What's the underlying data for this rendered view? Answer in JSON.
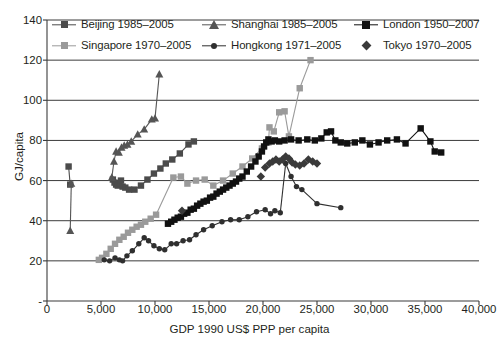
{
  "chart_data": {
    "type": "scatter",
    "title": "",
    "xlabel": "GDP 1990 US$ PPP per capita",
    "ylabel": "GJ/capita",
    "xlim": [
      0,
      40000
    ],
    "ylim": [
      0,
      140
    ],
    "xticks": [
      0,
      5000,
      10000,
      15000,
      20000,
      25000,
      30000,
      35000,
      40000
    ],
    "xticklabels": [
      "0",
      "5,000",
      "10,000",
      "15,000",
      "20,000",
      "25,000",
      "30,000",
      "35,000",
      "40,000"
    ],
    "yticks": [
      0,
      20,
      40,
      60,
      80,
      100,
      120,
      140
    ],
    "yticklabels": [
      "-",
      "20",
      "40",
      "60",
      "80",
      "100",
      "120",
      "140"
    ],
    "grid": "horizontal",
    "legend_position": "top-inside",
    "series": [
      {
        "name": "Beijing 1985–2005",
        "marker": "square",
        "color": "#4b4b4b",
        "line": true,
        "points": [
          [
            2000,
            67.0
          ],
          [
            2150,
            58.0
          ],
          [
            6100,
            60.5
          ],
          [
            6250,
            59.0
          ],
          [
            6400,
            58.0
          ],
          [
            6550,
            57.5
          ],
          [
            6700,
            58.5
          ],
          [
            6850,
            60.0
          ],
          [
            7000,
            57.0
          ],
          [
            7250,
            56.5
          ],
          [
            7600,
            55.5
          ],
          [
            8100,
            55.5
          ],
          [
            8700,
            57.5
          ],
          [
            9300,
            60.5
          ],
          [
            9900,
            63.5
          ],
          [
            10500,
            66.0
          ],
          [
            11000,
            68.5
          ],
          [
            11600,
            70.5
          ],
          [
            12300,
            73.5
          ],
          [
            13100,
            78.0
          ],
          [
            13600,
            79.5
          ]
        ]
      },
      {
        "name": "Shanghai 1985–2005",
        "marker": "triangle",
        "color": "#555555",
        "line": true,
        "points": [
          [
            2150,
            35.0
          ],
          [
            2250,
            58.5
          ],
          [
            6000,
            61.5
          ],
          [
            6200,
            69.5
          ],
          [
            6400,
            74.5
          ],
          [
            6650,
            74.0
          ],
          [
            6900,
            76.5
          ],
          [
            7150,
            77.5
          ],
          [
            7450,
            78.0
          ],
          [
            7800,
            79.5
          ],
          [
            8400,
            83.0
          ],
          [
            9000,
            85.5
          ],
          [
            9700,
            90.5
          ],
          [
            10000,
            91.0
          ],
          [
            10400,
            113.0
          ]
        ]
      },
      {
        "name": "Singapore 1970–2005",
        "marker": "square",
        "color": "#9a9a9a",
        "line": true,
        "points": [
          [
            4800,
            20.5
          ],
          [
            5100,
            21.5
          ],
          [
            5500,
            23.5
          ],
          [
            5900,
            26.0
          ],
          [
            6300,
            28.5
          ],
          [
            6700,
            30.5
          ],
          [
            7100,
            32.0
          ],
          [
            7500,
            34.0
          ],
          [
            7900,
            35.5
          ],
          [
            8300,
            37.0
          ],
          [
            8700,
            38.0
          ],
          [
            9100,
            39.5
          ],
          [
            9600,
            41.0
          ],
          [
            10100,
            43.0
          ],
          [
            11700,
            61.5
          ],
          [
            12400,
            62.0
          ],
          [
            13000,
            58.5
          ],
          [
            13800,
            60.0
          ],
          [
            14600,
            60.5
          ],
          [
            15400,
            57.5
          ],
          [
            16300,
            60.0
          ],
          [
            17200,
            63.5
          ],
          [
            18100,
            67.0
          ],
          [
            19000,
            71.0
          ],
          [
            19900,
            76.0
          ],
          [
            20500,
            79.0
          ],
          [
            20600,
            86.5
          ],
          [
            21000,
            84.5
          ],
          [
            21500,
            94.0
          ],
          [
            22000,
            94.5
          ],
          [
            22400,
            82.0
          ],
          [
            23400,
            106.0
          ],
          [
            24400,
            120.0
          ]
        ]
      },
      {
        "name": "Hongkong 1971–2005",
        "marker": "circle",
        "color": "#2f2f2f",
        "line": true,
        "points": [
          [
            5300,
            20.5
          ],
          [
            5800,
            20.0
          ],
          [
            6300,
            21.5
          ],
          [
            6700,
            20.5
          ],
          [
            7000,
            20.0
          ],
          [
            7400,
            22.5
          ],
          [
            7900,
            25.0
          ],
          [
            8500,
            28.5
          ],
          [
            9000,
            31.5
          ],
          [
            9400,
            30.0
          ],
          [
            9900,
            27.5
          ],
          [
            10400,
            26.0
          ],
          [
            10900,
            25.5
          ],
          [
            11500,
            28.5
          ],
          [
            12000,
            28.5
          ],
          [
            12600,
            30.0
          ],
          [
            13200,
            30.5
          ],
          [
            13800,
            33.0
          ],
          [
            14500,
            35.5
          ],
          [
            15300,
            37.5
          ],
          [
            16200,
            39.5
          ],
          [
            17000,
            40.5
          ],
          [
            17800,
            40.5
          ],
          [
            18600,
            42.0
          ],
          [
            19400,
            44.5
          ],
          [
            20200,
            45.5
          ],
          [
            20700,
            43.5
          ],
          [
            21100,
            45.0
          ],
          [
            21600,
            44.0
          ],
          [
            22100,
            68.5
          ],
          [
            22600,
            62.0
          ],
          [
            23100,
            57.0
          ],
          [
            23600,
            55.5
          ],
          [
            25000,
            48.5
          ],
          [
            27200,
            46.5
          ]
        ]
      },
      {
        "name": "London 1950–2007",
        "marker": "square",
        "color": "#111111",
        "line": true,
        "points": [
          [
            11200,
            38.5
          ],
          [
            11500,
            39.5
          ],
          [
            11800,
            40.5
          ],
          [
            12100,
            41.5
          ],
          [
            12400,
            42.0
          ],
          [
            12700,
            43.5
          ],
          [
            13000,
            44.0
          ],
          [
            13300,
            45.5
          ],
          [
            13600,
            46.0
          ],
          [
            13900,
            47.5
          ],
          [
            14200,
            48.5
          ],
          [
            14500,
            49.5
          ],
          [
            14800,
            50.0
          ],
          [
            15100,
            51.5
          ],
          [
            15400,
            52.0
          ],
          [
            15700,
            53.5
          ],
          [
            16000,
            54.5
          ],
          [
            16300,
            55.5
          ],
          [
            16600,
            56.5
          ],
          [
            16900,
            57.5
          ],
          [
            17200,
            58.5
          ],
          [
            17500,
            59.5
          ],
          [
            17800,
            61.0
          ],
          [
            18100,
            62.0
          ],
          [
            18500,
            64.5
          ],
          [
            18900,
            67.0
          ],
          [
            19300,
            69.5
          ],
          [
            19600,
            72.0
          ],
          [
            19900,
            74.5
          ],
          [
            20100,
            77.0
          ],
          [
            20300,
            79.0
          ],
          [
            20500,
            80.5
          ],
          [
            20800,
            79.5
          ],
          [
            21100,
            80.0
          ],
          [
            21500,
            79.5
          ],
          [
            22000,
            80.0
          ],
          [
            22600,
            80.5
          ],
          [
            23300,
            80.0
          ],
          [
            24100,
            80.5
          ],
          [
            24800,
            80.0
          ],
          [
            25400,
            81.0
          ],
          [
            25900,
            84.0
          ],
          [
            26300,
            84.5
          ],
          [
            26700,
            80.0
          ],
          [
            27200,
            79.0
          ],
          [
            27800,
            78.5
          ],
          [
            28500,
            79.0
          ],
          [
            29200,
            80.0
          ],
          [
            29900,
            78.0
          ],
          [
            30700,
            79.0
          ],
          [
            31500,
            80.0
          ],
          [
            32400,
            80.5
          ],
          [
            33200,
            78.5
          ],
          [
            34600,
            86.0
          ],
          [
            35500,
            79.5
          ],
          [
            35900,
            74.5
          ],
          [
            36500,
            74.0
          ]
        ]
      },
      {
        "name": "Tokyo 1970–2005",
        "marker": "diamond",
        "color": "#3a3a3a",
        "line": false,
        "points": [
          [
            12500,
            45.0
          ],
          [
            19800,
            62.0
          ],
          [
            20200,
            66.5
          ],
          [
            20600,
            68.5
          ],
          [
            20900,
            69.5
          ],
          [
            21200,
            70.5
          ],
          [
            21500,
            69.5
          ],
          [
            21800,
            70.5
          ],
          [
            22100,
            72.0
          ],
          [
            22400,
            71.0
          ],
          [
            22700,
            69.0
          ],
          [
            23000,
            68.0
          ],
          [
            23400,
            67.5
          ],
          [
            23800,
            68.5
          ],
          [
            24200,
            70.5
          ],
          [
            24600,
            69.5
          ],
          [
            25000,
            68.5
          ]
        ]
      }
    ]
  },
  "legend": {
    "entries": [
      {
        "label": "Beijing 1985–2005",
        "marker": "square",
        "color": "#4b4b4b",
        "line": true
      },
      {
        "label": "Shanghai 1985–2005",
        "marker": "triangle",
        "color": "#555555",
        "line": true
      },
      {
        "label": "London 1950–2007",
        "marker": "square-lg",
        "color": "#111111",
        "line": true
      },
      {
        "label": "Singapore 1970–2005",
        "marker": "square",
        "color": "#9a9a9a",
        "line": true
      },
      {
        "label": "Hongkong 1971–2005",
        "marker": "circle",
        "color": "#2f2f2f",
        "line": true
      },
      {
        "label": "Tokyo 1970–2005",
        "marker": "diamond",
        "color": "#3a3a3a",
        "line": false
      }
    ]
  },
  "axes": {
    "x_title": "GDP 1990 US$ PPP per capita",
    "y_title": "GJ/capita"
  }
}
